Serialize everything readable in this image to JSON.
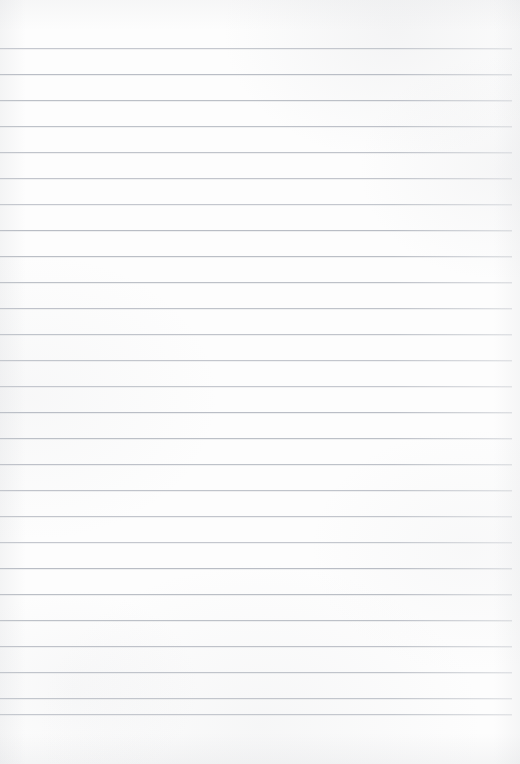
{
  "document": {
    "kind": "ruled-notebook-paper-scan",
    "title": "Blank Ruled Paper",
    "width": 520,
    "height": 764,
    "content_text": "",
    "has_text": false,
    "has_margin_rule": false
  },
  "paper": {
    "background_color": "#fdfdfd",
    "edge_tint_color": "#cdcfd3",
    "top_margin": 48,
    "bottom_margin": 50,
    "left_inset": 0,
    "right_inset": 8
  },
  "ruling": {
    "line_color": "#b9bdc5",
    "line_thickness": 1,
    "line_spacing": 26,
    "first_line_y": 48,
    "last_line_y": 714,
    "line_count": 27,
    "line_start_x": 0,
    "line_end_x": 512,
    "line_y_positions": [
      48,
      74,
      100,
      126,
      152,
      178,
      204,
      230,
      256,
      282,
      308,
      334,
      360,
      386,
      412,
      438,
      464,
      490,
      516,
      542,
      568,
      594,
      620,
      646,
      672,
      698,
      714
    ]
  }
}
